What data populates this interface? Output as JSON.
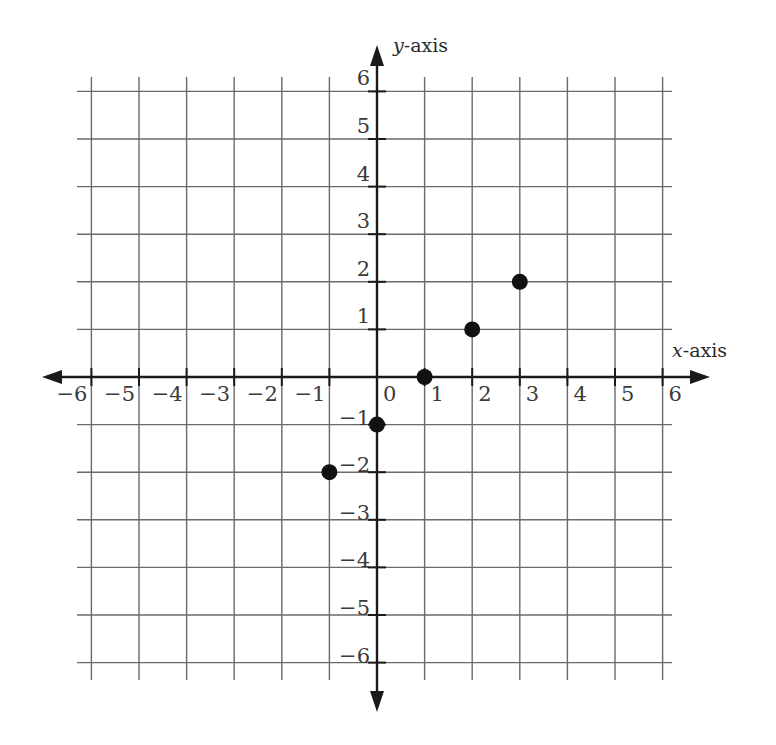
{
  "chart_data": {
    "type": "scatter",
    "title": "",
    "xlabel": "x-axis",
    "ylabel": "y-axis",
    "xlim": [
      -6,
      6
    ],
    "ylim": [
      -6,
      6
    ],
    "grid": true,
    "x_ticks": [
      "−6",
      "−5",
      "−4",
      "−3",
      "−2",
      "−1",
      "0",
      "1",
      "2",
      "3",
      "4",
      "5",
      "6"
    ],
    "y_ticks": [
      "−6",
      "−5",
      "−4",
      "−3",
      "−2",
      "−1",
      "1",
      "2",
      "3",
      "4",
      "5",
      "6"
    ],
    "points": [
      {
        "x": -1,
        "y": -2
      },
      {
        "x": 0,
        "y": -1
      },
      {
        "x": 1,
        "y": 0
      },
      {
        "x": 2,
        "y": 1
      },
      {
        "x": 3,
        "y": 2
      }
    ],
    "x": [
      -1,
      0,
      1,
      2,
      3
    ],
    "series": [
      {
        "name": "points",
        "values": [
          -2,
          -1,
          0,
          1,
          2
        ]
      }
    ]
  },
  "labels": {
    "x_axis": "-axis",
    "x_axis_var": "x",
    "y_axis": "-axis",
    "y_axis_var": "y"
  }
}
